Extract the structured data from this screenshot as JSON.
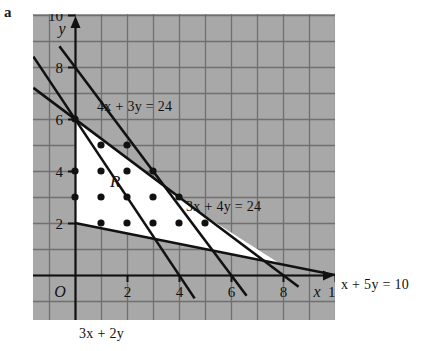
{
  "figure": {
    "panel_label": "a",
    "background": "#ffffff",
    "plot_bg": "#a8a8a8",
    "grid_color": "#6e6e6e",
    "axis_color": "#111111",
    "line_color": "#111111",
    "region_fill": "#ffffff",
    "region_label": "R",
    "origin_label": "O"
  },
  "axes": {
    "x_label": "x",
    "y_label": "y",
    "x_ticks": [
      "2",
      "4",
      "6",
      "8",
      "10"
    ],
    "y_ticks": [
      "2",
      "4",
      "6",
      "8",
      "10"
    ],
    "x_tick_values": [
      2,
      4,
      6,
      8,
      10
    ],
    "y_tick_values": [
      2,
      4,
      6,
      8,
      10
    ],
    "x_range": [
      -1.6,
      10.9
    ],
    "y_range": [
      -1.0,
      10.9
    ]
  },
  "labels": {
    "line_4x3y": "4x + 3y = 24",
    "line_3x4y": "3x + 4y = 24",
    "line_x5y": "x + 5y = 10",
    "objective": "3x + 2y"
  },
  "chart_data": {
    "type": "scatter",
    "title": "",
    "xlabel": "x",
    "ylabel": "y",
    "xlim": [
      -1.6,
      10.9
    ],
    "ylim": [
      -1.0,
      10.9
    ],
    "grid": true,
    "legend": "none",
    "lines": [
      {
        "name": "4x + 3y = 24",
        "label": "4x + 3y = 24",
        "equation": "4x + 3y = 24",
        "points": [
          [
            0,
            8
          ],
          [
            6,
            0
          ]
        ],
        "draw_from": [
          -0.6,
          8.8
        ],
        "draw_to": [
          6.6,
          -0.8
        ]
      },
      {
        "name": "3x + 4y = 24",
        "label": "3x + 4y = 24",
        "equation": "3x + 4y = 24",
        "points": [
          [
            0,
            6
          ],
          [
            8,
            0
          ]
        ],
        "draw_from": [
          -1.6,
          7.2
        ],
        "draw_to": [
          8.6,
          -0.45
        ]
      },
      {
        "name": "x + 5y = 10",
        "label": "x + 5y = 10",
        "equation": "x + 5y = 10",
        "points": [
          [
            0,
            2
          ],
          [
            10,
            0
          ]
        ],
        "draw_from": [
          0,
          2
        ],
        "draw_to": [
          10,
          0
        ]
      },
      {
        "name": "3x + 2y",
        "label": "3x + 2y",
        "equation": "3x + 2y",
        "points": [
          [
            0,
            6
          ],
          [
            4,
            0
          ]
        ],
        "draw_from": [
          -1.6,
          8.4
        ],
        "draw_to": [
          4.6,
          -0.9
        ]
      }
    ],
    "region": {
      "name": "R",
      "label": "R",
      "vertices": [
        [
          0,
          6
        ],
        [
          4.8,
          2.4
        ],
        [
          8,
          0.4
        ],
        [
          2,
          1.6
        ],
        [
          0,
          2
        ]
      ],
      "polygon": [
        [
          0,
          6
        ],
        [
          4.8,
          2.4
        ],
        [
          7.9,
          0.42
        ],
        [
          1.95,
          1.61
        ],
        [
          0,
          2
        ]
      ]
    },
    "lattice_points": [
      [
        0,
        6
      ],
      [
        1,
        5
      ],
      [
        2,
        5
      ],
      [
        0,
        4
      ],
      [
        1,
        4
      ],
      [
        2,
        4
      ],
      [
        3,
        4
      ],
      [
        0,
        3
      ],
      [
        1,
        3
      ],
      [
        2,
        3
      ],
      [
        3,
        3
      ],
      [
        4,
        3
      ],
      [
        1,
        2
      ],
      [
        2,
        2
      ],
      [
        3,
        2
      ],
      [
        4,
        2
      ],
      [
        5,
        2
      ]
    ],
    "marked_axis_points": [
      [
        0,
        6
      ],
      [
        0,
        2
      ]
    ]
  }
}
